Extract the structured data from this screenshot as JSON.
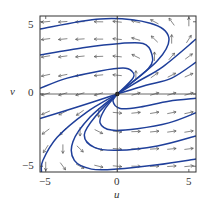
{
  "chart_data": {
    "type": "phase-portrait",
    "title": "",
    "xlabel": "u",
    "ylabel": "v",
    "xlim": [
      -5.4,
      5.5
    ],
    "ylim": [
      -5.4,
      5.4
    ],
    "xticks": [
      -5,
      0,
      5
    ],
    "yticks": [
      -5,
      0,
      5
    ],
    "xtick_labels": [
      "−5",
      "0",
      "5"
    ],
    "ytick_labels": [
      "−5",
      "0",
      "5"
    ],
    "grid": false,
    "axes_lines": {
      "u": 0,
      "v": 0
    },
    "vector_field": {
      "u_dot": "u - v",
      "v_dot": "0.3*u + 0.1*v",
      "grid_u": [
        -5,
        -3.8,
        -2.6,
        -1.3,
        0,
        1.3,
        2.6,
        3.8,
        5
      ],
      "grid_v": [
        5,
        3.8,
        2.6,
        1.3,
        0,
        -1.3,
        -2.6,
        -3.8,
        -5
      ],
      "arrow_color": "#555555"
    },
    "trajectories": {
      "color": "#1f3f9a",
      "series": [
        {
          "name": "traj-1",
          "points": [
            [
              0,
              0
            ],
            [
              2.8,
              2.3
            ],
            [
              3.6,
              3.9
            ],
            [
              2.3,
              4.9
            ],
            [
              -1.2,
              5.2
            ],
            [
              -5.4,
              4.5
            ]
          ]
        },
        {
          "name": "traj-2",
          "points": [
            [
              0,
              0
            ],
            [
              2.2,
              1.8
            ],
            [
              2.4,
              2.8
            ],
            [
              1.8,
              3.5
            ],
            [
              0.2,
              3.5
            ],
            [
              -2.4,
              3.2
            ],
            [
              -5.4,
              2.7
            ]
          ]
        },
        {
          "name": "traj-3",
          "points": [
            [
              0,
              0
            ],
            [
              1.1,
              1.1
            ],
            [
              1.0,
              1.6
            ],
            [
              0.4,
              1.8
            ],
            [
              -1.2,
              1.6
            ],
            [
              -3.5,
              1.1
            ],
            [
              -5.4,
              0.4
            ]
          ]
        },
        {
          "name": "traj-4",
          "points": [
            [
              0,
              0
            ],
            [
              1.5,
              0.9
            ],
            [
              3.2,
              1.9
            ],
            [
              5.5,
              3.8
            ]
          ]
        },
        {
          "name": "traj-5",
          "points": [
            [
              0,
              0
            ],
            [
              2.0,
              0.6
            ],
            [
              3.8,
              1.1
            ],
            [
              5.5,
              2.2
            ]
          ]
        },
        {
          "name": "traj-6",
          "points": [
            [
              0,
              0
            ],
            [
              -2.8,
              -0.9
            ],
            [
              -5.4,
              -1.7
            ]
          ]
        },
        {
          "name": "traj-7",
          "points": [
            [
              0,
              0
            ],
            [
              -2.2,
              -1.3
            ],
            [
              -4.2,
              -3.0
            ],
            [
              -5.2,
              -4.6
            ],
            [
              -5.3,
              -5.4
            ]
          ]
        },
        {
          "name": "traj-8",
          "points": [
            [
              0,
              0
            ],
            [
              -1.9,
              -1.6
            ],
            [
              -3.1,
              -3.3
            ],
            [
              -3.0,
              -4.6
            ],
            [
              -1.8,
              -5.2
            ],
            [
              0,
              -5.2
            ],
            [
              2.8,
              -4.9
            ],
            [
              5.5,
              -4.5
            ]
          ]
        },
        {
          "name": "traj-9",
          "points": [
            [
              0,
              0
            ],
            [
              -1.4,
              -1.4
            ],
            [
              -2.3,
              -2.8
            ],
            [
              -1.6,
              -3.7
            ],
            [
              0,
              -3.9
            ],
            [
              2.8,
              -3.6
            ],
            [
              5.5,
              -2.9
            ]
          ]
        },
        {
          "name": "traj-10",
          "points": [
            [
              0,
              0
            ],
            [
              -0.9,
              -1.1
            ],
            [
              -1.2,
              -2.0
            ],
            [
              -0.4,
              -2.5
            ],
            [
              1.4,
              -2.4
            ],
            [
              3.6,
              -2.0
            ],
            [
              5.5,
              -1.3
            ]
          ]
        },
        {
          "name": "traj-11",
          "points": [
            [
              0,
              0
            ],
            [
              -0.3,
              -0.5
            ],
            [
              0.2,
              -1.0
            ],
            [
              1.6,
              -0.9
            ],
            [
              3.6,
              -0.5
            ],
            [
              5.5,
              -0.3
            ]
          ]
        }
      ]
    }
  },
  "labels": {
    "xlabel": "u",
    "ylabel": "v",
    "xtick_neg5": "−5",
    "xtick_0": "0",
    "xtick_5": "5",
    "ytick_5": "5",
    "ytick_0": "0",
    "ytick_neg5": "−5"
  },
  "colors": {
    "frame": "#333333",
    "trajectory": "#1f3f9a",
    "arrow": "#555555"
  }
}
